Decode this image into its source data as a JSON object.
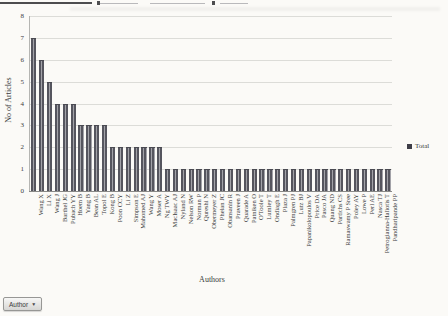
{
  "chart_data": {
    "type": "bar",
    "categories": [
      "Wang X",
      "Li X",
      "Wang J",
      "Barthel JG",
      "Pubach YY",
      "Hoem B",
      "Yang B",
      "Bean AL",
      "Topol E",
      "Kong B",
      "Poon CCY",
      "Li Z",
      "Simpson E",
      "Mahomed AJ",
      "Wang Y",
      "Moser A",
      "Ng TWY",
      "MacIsaac AJ",
      "Nyland N",
      "Nelson RW",
      "Norman P",
      "Qureshi N",
      "Obermeyer Z",
      "Phelan JC",
      "Obansanin R",
      "Praveen J",
      "Quarade A",
      "Patniken O",
      "O'Toole T",
      "Lumley T",
      "Ondiagh E",
      "Plaza J",
      "Palmgren PJ",
      "Lutz BJ",
      "Papanikolopoulos V",
      "Price DA",
      "Pasco JA",
      "Quang ND",
      "Partichs CS",
      "Ramaswamy P Sree",
      "Poley AY",
      "Lowe P",
      "Perl AE",
      "Nasca TJ",
      "Petrogianna-Haliotis T",
      "Pandharipande PP"
    ],
    "values": [
      7,
      6,
      5,
      4,
      4,
      4,
      3,
      3,
      3,
      3,
      2,
      2,
      2,
      2,
      2,
      2,
      2,
      1,
      1,
      1,
      1,
      1,
      1,
      1,
      1,
      1,
      1,
      1,
      1,
      1,
      1,
      1,
      1,
      1,
      1,
      1,
      1,
      1,
      1,
      1,
      1,
      1,
      1,
      1,
      1,
      1
    ],
    "series": [
      {
        "name": "Total"
      }
    ],
    "xlabel": "Authors",
    "ylabel": "No of Articles",
    "ylim": [
      0,
      8
    ],
    "yticks": [
      0,
      1,
      2,
      3,
      4,
      5,
      6,
      7,
      8
    ],
    "grid": "horizontal",
    "legend_position": "right",
    "bar_color": "#55555e",
    "legend_marker_color": "#3e3e48"
  },
  "axes": {
    "x_title": "Authors",
    "y_title": "No of Articles"
  },
  "legend": {
    "label": "Total"
  },
  "field_button": {
    "label": "Author",
    "arrow_icon": "▼"
  }
}
